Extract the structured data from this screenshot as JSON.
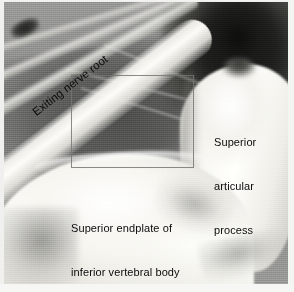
{
  "figure": {
    "kind": "anatomical-photograph",
    "modality": "endoscopic cadaveric spine view",
    "width": 294,
    "height": 292,
    "palette": {
      "background": "#8d8d8b",
      "bone_highlight": "#fffffc",
      "soft_tissue_mid": "#8a8a88",
      "dark_recess": "#151514",
      "label_text": "#0b0b0b",
      "roi_outline": "#767672",
      "page_border": "#f4f4f2"
    }
  },
  "labels": {
    "nerve_root": {
      "text": "Exiting nerve root",
      "rotation_deg": -37.5,
      "structure": "exiting-nerve-root"
    },
    "articular_process": {
      "line1": "Superior",
      "line2": "articular",
      "line3": "process",
      "structure": "superior-articular-process"
    },
    "endplate": {
      "line1": "Superior endplate of",
      "line2": "inferior vertebral body",
      "structure": "superior-endplate-inferior-vertebral-body"
    }
  },
  "roi": {
    "name": "region-of-interest-box",
    "x": 67,
    "y": 73,
    "width": 123,
    "height": 93
  }
}
